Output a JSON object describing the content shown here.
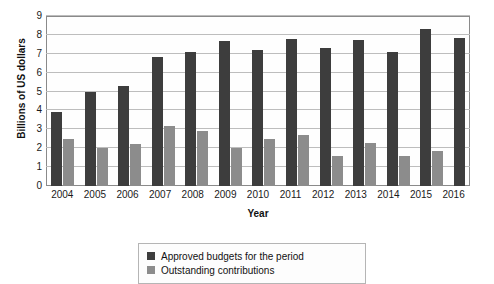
{
  "chart_data": {
    "type": "bar",
    "title": "",
    "xlabel": "Year",
    "ylabel": "Billions of US dollars",
    "ylim": [
      0,
      9
    ],
    "yticks": [
      0,
      1,
      2,
      3,
      4,
      5,
      6,
      7,
      8,
      9
    ],
    "grid": true,
    "legend_position": "bottom",
    "categories": [
      "2004",
      "2005",
      "2006",
      "2007",
      "2008",
      "2009",
      "2010",
      "2011",
      "2012",
      "2013",
      "2014",
      "2015",
      "2016"
    ],
    "series": [
      {
        "name": "Approved budgets for the period",
        "color": "#3d3d3d",
        "values": [
          3.9,
          5.0,
          5.3,
          6.85,
          7.1,
          7.7,
          7.2,
          7.8,
          7.3,
          7.75,
          7.1,
          8.3,
          7.85
        ]
      },
      {
        "name": "Outstanding contributions",
        "color": "#8c8c8c",
        "values": [
          2.5,
          2.0,
          2.2,
          3.2,
          2.9,
          2.0,
          2.5,
          2.7,
          1.6,
          2.3,
          1.6,
          1.85,
          0
        ]
      }
    ]
  },
  "axes": {
    "y_title": "Billions of US dollars",
    "x_title": "Year"
  },
  "legend": {
    "entries": [
      {
        "label": "Approved budgets for the period",
        "color": "#3d3d3d"
      },
      {
        "label": "Outstanding contributions",
        "color": "#8c8c8c"
      }
    ]
  }
}
